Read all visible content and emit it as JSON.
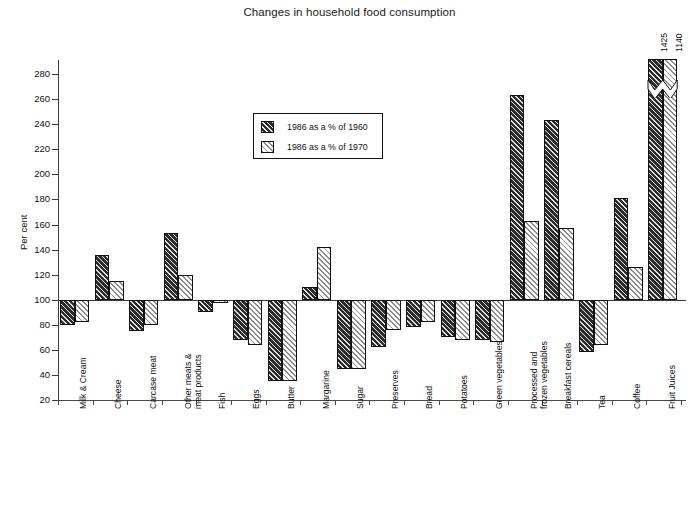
{
  "chart_data": {
    "type": "bar",
    "title": "Changes in household food consumption",
    "xlabel": "",
    "ylabel": "Per cent",
    "ylim": [
      20,
      280
    ],
    "ytick_step": 20,
    "yticks": [
      20,
      40,
      60,
      80,
      100,
      120,
      140,
      160,
      180,
      200,
      220,
      240,
      260,
      280
    ],
    "grid": false,
    "baseline": 100,
    "legend_position": "upper-center",
    "categories": [
      "Milk & Cream",
      "Cheese",
      "Carcase meat",
      "Other meats & meat products",
      "Fish",
      "Eggs",
      "Butter",
      "Margarine",
      "Sugar",
      "Preserves",
      "Bread",
      "Potatoes",
      "Green vegetables",
      "Processed and frozen vegetables",
      "Breakfast cereals",
      "Tea",
      "Coffee",
      "Fruit Juices"
    ],
    "series": [
      {
        "name": "1986 as a % of 1960",
        "values": [
          80,
          136,
          75,
          153,
          90,
          68,
          35,
          110,
          45,
          62,
          78,
          70,
          68,
          263,
          243,
          58,
          181,
          1425
        ]
      },
      {
        "name": "1986 as a % of 1970",
        "values": [
          82,
          115,
          80,
          120,
          97,
          64,
          35,
          142,
          45,
          76,
          82,
          68,
          66,
          163,
          157,
          64,
          126,
          1140
        ]
      }
    ],
    "annotations": [
      {
        "label": "1425",
        "category": "Fruit Juices",
        "series": "1986 as a % of 1960"
      },
      {
        "label": "1140",
        "category": "Fruit Juices",
        "series": "1986 as a % of 1970"
      }
    ],
    "axis_break": {
      "present": true,
      "applies_to": [
        "Fruit Juices"
      ],
      "style": "zigzag"
    }
  },
  "legend": {
    "entries": [
      {
        "label": "1986 as a % of 1960",
        "pattern": "dark-hatch"
      },
      {
        "label": "1986 as a % of 1970",
        "pattern": "light-hatch"
      }
    ]
  },
  "colors": {
    "dark_bar": "#2b2b2b",
    "light_bar": "#ffffff",
    "hatch": "#8d8d8d",
    "axis": "#3a3a3a",
    "text": "#111111"
  }
}
